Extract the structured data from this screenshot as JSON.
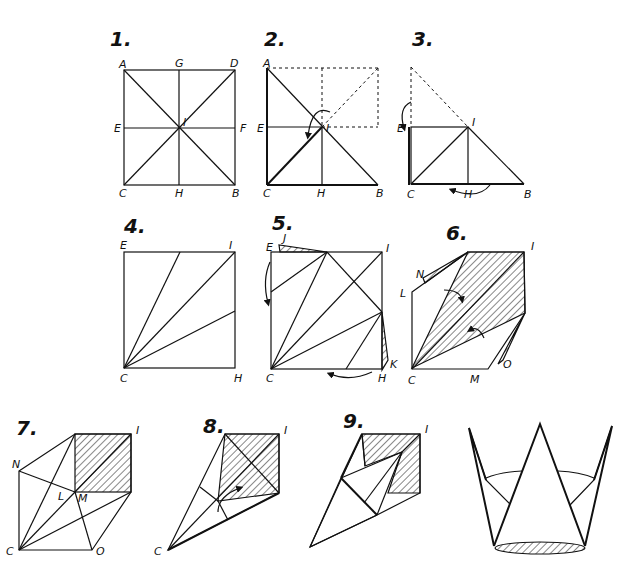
{
  "steps": [
    {
      "number": "1.",
      "labels": {
        "A": "A",
        "G": "G",
        "D": "D",
        "E": "E",
        "I": "I",
        "F": "F",
        "C": "C",
        "H": "H",
        "B": "B"
      }
    },
    {
      "number": "2.",
      "labels": {
        "A": "A",
        "E": "E",
        "I": "I",
        "C": "C",
        "H": "H",
        "B": "B"
      }
    },
    {
      "number": "3.",
      "labels": {
        "E": "E",
        "I": "I",
        "C": "C",
        "H": "H",
        "B": "B"
      }
    },
    {
      "number": "4.",
      "labels": {
        "E": "E",
        "I": "I",
        "C": "C",
        "H": "H"
      }
    },
    {
      "number": "5.",
      "labels": {
        "E": "E",
        "J": "J",
        "I": "I",
        "C": "C",
        "H": "H",
        "K": "K"
      }
    },
    {
      "number": "6.",
      "labels": {
        "N": "N",
        "I": "I",
        "L": "L",
        "C": "C",
        "M": "M",
        "O": "O"
      }
    },
    {
      "number": "7.",
      "labels": {
        "I": "I",
        "N": "N",
        "L": "L",
        "M": "M",
        "C": "C",
        "O": "O"
      }
    },
    {
      "number": "8.",
      "labels": {
        "I": "I",
        "C": "C"
      }
    },
    {
      "number": "9.",
      "labels": {
        "I": "I"
      }
    }
  ],
  "final": {
    "description": "finished crown"
  }
}
